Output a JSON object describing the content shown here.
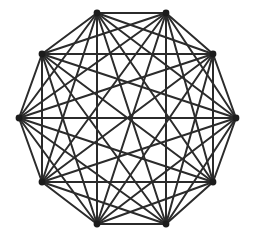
{
  "figure": {
    "type": "graph-diagram",
    "background_color": "#ffffff",
    "canvas": {
      "width": 255,
      "height": 239
    }
  },
  "chart_data": {
    "type": "scatter",
    "subtitle": "",
    "xlabel": "",
    "ylabel": "",
    "grid": false,
    "legend": null,
    "xlim": [
      0,
      255
    ],
    "ylim": [
      0,
      239
    ],
    "graph": {
      "name": "K10",
      "vertex_count": 10,
      "edge_count": 45,
      "is_complete": true,
      "degree_per_vertex": 9,
      "layout": "regular-decagon",
      "center": {
        "x": 128,
        "y": 118
      },
      "circumradius": 108,
      "angle_offset_degrees": -108
    },
    "vertices": [
      {
        "id": 0,
        "label": "v1",
        "x": 97,
        "y": 13,
        "position": "top-left"
      },
      {
        "id": 1,
        "label": "v2",
        "x": 166,
        "y": 13,
        "position": "top-right"
      },
      {
        "id": 2,
        "label": "v3",
        "x": 213,
        "y": 54,
        "position": "upper-right"
      },
      {
        "id": 3,
        "label": "v4",
        "x": 236,
        "y": 118,
        "position": "right"
      },
      {
        "id": 4,
        "label": "v5",
        "x": 213,
        "y": 182,
        "position": "lower-right"
      },
      {
        "id": 5,
        "label": "v6",
        "x": 166,
        "y": 224,
        "position": "bottom-right"
      },
      {
        "id": 6,
        "label": "v7",
        "x": 97,
        "y": 224,
        "position": "bottom-left"
      },
      {
        "id": 7,
        "label": "v8",
        "x": 42,
        "y": 182,
        "position": "lower-left"
      },
      {
        "id": 8,
        "label": "v9",
        "x": 19,
        "y": 118,
        "position": "left"
      },
      {
        "id": 9,
        "label": "v10",
        "x": 42,
        "y": 54,
        "position": "upper-left"
      }
    ],
    "edges": [
      [
        0,
        1
      ],
      [
        0,
        2
      ],
      [
        0,
        3
      ],
      [
        0,
        4
      ],
      [
        0,
        5
      ],
      [
        0,
        6
      ],
      [
        0,
        7
      ],
      [
        0,
        8
      ],
      [
        0,
        9
      ],
      [
        1,
        2
      ],
      [
        1,
        3
      ],
      [
        1,
        4
      ],
      [
        1,
        5
      ],
      [
        1,
        6
      ],
      [
        1,
        7
      ],
      [
        1,
        8
      ],
      [
        1,
        9
      ],
      [
        2,
        3
      ],
      [
        2,
        4
      ],
      [
        2,
        5
      ],
      [
        2,
        6
      ],
      [
        2,
        7
      ],
      [
        2,
        8
      ],
      [
        2,
        9
      ],
      [
        3,
        4
      ],
      [
        3,
        5
      ],
      [
        3,
        6
      ],
      [
        3,
        7
      ],
      [
        3,
        8
      ],
      [
        3,
        9
      ],
      [
        4,
        5
      ],
      [
        4,
        6
      ],
      [
        4,
        7
      ],
      [
        4,
        8
      ],
      [
        4,
        9
      ],
      [
        5,
        6
      ],
      [
        5,
        7
      ],
      [
        5,
        8
      ],
      [
        5,
        9
      ],
      [
        6,
        7
      ],
      [
        6,
        8
      ],
      [
        6,
        9
      ],
      [
        7,
        8
      ],
      [
        7,
        9
      ],
      [
        8,
        9
      ]
    ],
    "style": {
      "edge_color": "#2b2b2b",
      "edge_width": 2,
      "vertex_color": "#1c1c1c",
      "vertex_radius": 3.4
    }
  }
}
